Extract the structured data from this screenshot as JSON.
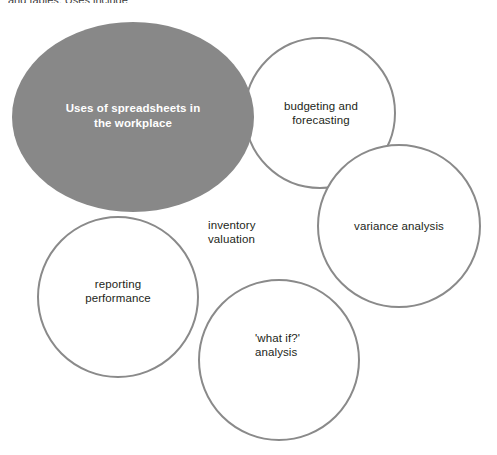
{
  "page": {
    "background_color": "#ffffff",
    "cropped_caption_text": "and tables. Uses include:"
  },
  "diagram": {
    "type": "bubble-cluster",
    "stroke_color": "#8a8a8a",
    "stroke_width": 2,
    "center_fill_color": "#888888",
    "center_text_color": "#ffffff",
    "node_text_color": "#231f20",
    "center": {
      "label": "Uses of spreadsheets in\nthe workplace",
      "shape": "ellipse",
      "cx": 133,
      "cy": 117,
      "rx": 121,
      "ry": 95
    },
    "nodes": [
      {
        "id": "budgeting",
        "label": "budgeting and\nforecasting",
        "shape": "circle",
        "cx": 320,
        "cy": 113,
        "r": 75,
        "align": "center",
        "label_x": 267,
        "label_y": 99,
        "label_w": 108
      },
      {
        "id": "variance",
        "label": "variance analysis",
        "shape": "circle",
        "cx": 399,
        "cy": 226,
        "r": 81,
        "align": "center",
        "label_x": 339,
        "label_y": 219,
        "label_w": 120
      },
      {
        "id": "inventory",
        "label": "inventory\nvaluation",
        "shape": "none",
        "cx": 210,
        "cy": 232,
        "r": 0,
        "align": "left",
        "label_x": 208,
        "label_y": 218,
        "label_w": 90
      },
      {
        "id": "reporting",
        "label": "reporting\nperformance",
        "shape": "circle",
        "cx": 118,
        "cy": 297,
        "r": 80,
        "align": "center",
        "label_x": 62,
        "label_y": 277,
        "label_w": 112
      },
      {
        "id": "what-if",
        "label": "'what if?'\nanalysis",
        "shape": "circle",
        "cx": 279,
        "cy": 360,
        "r": 80,
        "align": "left",
        "label_x": 255,
        "label_y": 331,
        "label_w": 90
      }
    ]
  }
}
